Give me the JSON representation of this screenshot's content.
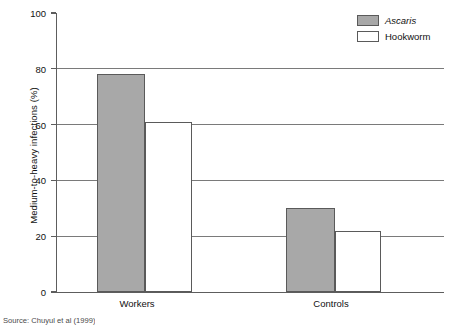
{
  "chart_data": {
    "type": "bar",
    "title": "",
    "subtitle": "",
    "xlabel": "",
    "ylabel": "Medium-to-heavy infections (%)",
    "categories": [
      "Workers",
      "Controls"
    ],
    "series": [
      {
        "name": "Ascaris",
        "values": [
          78,
          30
        ],
        "color": "#a8a8a8",
        "italic_label": true
      },
      {
        "name": "Hookworm",
        "values": [
          61,
          22
        ],
        "color": "#ffffff",
        "italic_label": false
      }
    ],
    "ylim": [
      0,
      100
    ],
    "ytick_values": [
      0,
      20,
      40,
      60,
      80,
      100
    ],
    "ytick_labels": [
      "0",
      "20",
      "40",
      "60",
      "80",
      "100"
    ],
    "gridlines_at": [
      20,
      40,
      60,
      80
    ],
    "grid": true,
    "legend_position": "top-right"
  },
  "axis": {
    "y_title": "Medium-to-heavy infections (%)",
    "ticks": [
      {
        "label": "100",
        "value": 100
      },
      {
        "label": "80",
        "value": 80
      },
      {
        "label": "60",
        "value": 60
      },
      {
        "label": "40",
        "value": 40
      },
      {
        "label": "20",
        "value": 20
      },
      {
        "label": "0",
        "value": 0
      }
    ]
  },
  "categories": [
    {
      "label": "Workers"
    },
    {
      "label": "Controls"
    }
  ],
  "legend": {
    "items": [
      {
        "label": "Ascaris",
        "color": "#a8a8a8"
      },
      {
        "label": "Hookworm",
        "color": "#ffffff"
      }
    ]
  },
  "caption": {
    "source": "Source: Chuyul et al (1999)"
  },
  "colors": {
    "ascaris_fill": "#a8a8a8",
    "hookworm_fill": "#ffffff",
    "bar_border": "#5a5a5a",
    "axis": "#5d5d5d",
    "gridline": "#7a7a7a",
    "text": "#111111"
  }
}
